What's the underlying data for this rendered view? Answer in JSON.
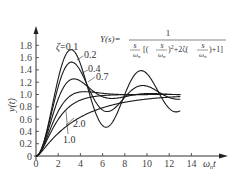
{
  "chart_data": {
    "type": "line",
    "title": "",
    "xlabel": "ωnt",
    "ylabel": "y(t)",
    "xlim": [
      0,
      15
    ],
    "ylim": [
      0,
      1.9
    ],
    "grid": false,
    "x_ticks": [
      0,
      2,
      4,
      6,
      8,
      10,
      12,
      14
    ],
    "y_ticks": [
      0,
      0.2,
      0.4,
      0.6,
      0.8,
      1.0,
      1.2,
      1.4,
      1.6,
      1.8
    ],
    "x_tick_labels": [
      "0",
      "2",
      "4",
      "6",
      "8",
      "10",
      "12",
      "14"
    ],
    "y_tick_labels": [
      "0",
      "0.2",
      "0.4",
      "0.6",
      "0.8",
      "1.0",
      "1.2",
      "1.4",
      "1.6",
      "1.8"
    ],
    "x_range_plotted": [
      0,
      13
    ],
    "series": [
      {
        "name": "ζ=0.1",
        "zeta": 0.1,
        "peak_value": 1.73,
        "peak_time": 3.16
      },
      {
        "name": "0.2",
        "zeta": 0.2,
        "peak_value": 1.53,
        "peak_time": 3.2
      },
      {
        "name": "0.4",
        "zeta": 0.4,
        "peak_value": 1.25,
        "peak_time": 3.43
      },
      {
        "name": "0.7",
        "zeta": 0.7,
        "peak_value": 1.05,
        "peak_time": 4.4
      },
      {
        "name": "1.0",
        "zeta": 1.0,
        "final_value": 1.0
      },
      {
        "name": "2.0",
        "zeta": 2.0,
        "final_value": 1.0
      }
    ],
    "annotations": {
      "zeta_label": "ζ=0.1",
      "formula_lhs": "Y(s)=",
      "formula_numerator": "1",
      "formula_denominator": "s/ωn [(s/ωn)²+2ζ(s/ωn)+1]"
    },
    "legend_position": "inline labels"
  },
  "axis": {
    "y_label": "y(t)",
    "x_label_main": "ω",
    "x_label_sub": "n",
    "x_label_tail": "t"
  },
  "labels": {
    "z01": "ζ=0.1",
    "z02": "0.2",
    "z04": "0.4",
    "z07": "0.7",
    "z10": "1.0",
    "z20": "2.0"
  },
  "formula": {
    "lhs": "Y(s)=",
    "num": "1",
    "s": "s",
    "wn": "ω",
    "n": "n",
    "bracket_open": "[(",
    "sq_part": ")",
    "sup2": "2",
    "plus2z": "+2ζ(",
    "close": ")+1]"
  },
  "style": {
    "line_color": "#1a1a1a",
    "axis_color": "#333333"
  }
}
